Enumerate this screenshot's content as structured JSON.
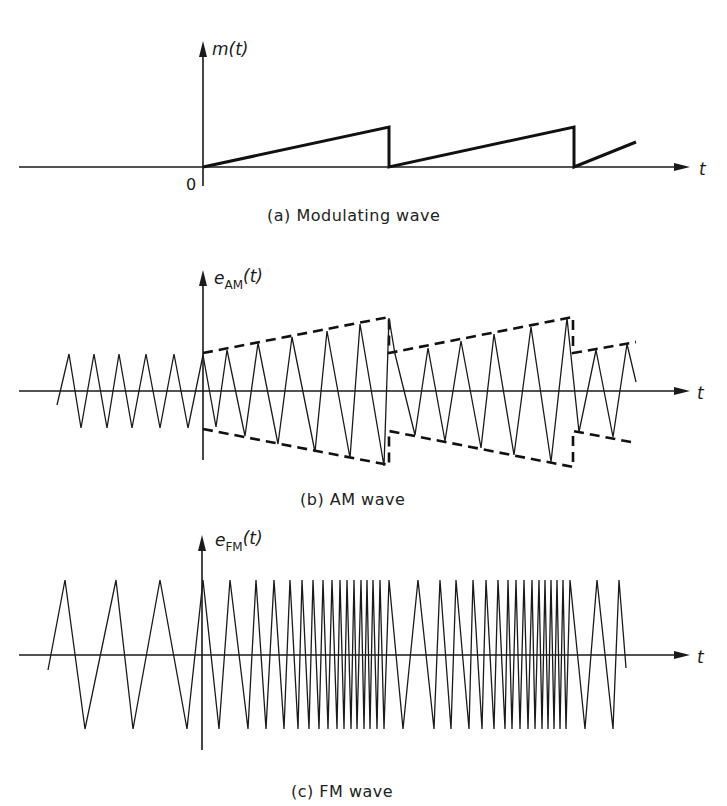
{
  "figure": {
    "panels": [
      {
        "id": "a",
        "caption": "(a) Modulating wave",
        "y_label_main": "m",
        "y_label_sub": "",
        "y_label_arg": "(t)",
        "x_label": "t",
        "origin_label": "0"
      },
      {
        "id": "b",
        "caption": "(b) AM wave",
        "y_label_main": "e",
        "y_label_sub": "AM",
        "y_label_arg": "(t)",
        "x_label": "t"
      },
      {
        "id": "c",
        "caption": "(c) FM wave",
        "y_label_main": "e",
        "y_label_sub": "FM",
        "y_label_arg": "(t)",
        "x_label": "t"
      }
    ]
  },
  "geometry": {
    "a": {
      "axis_y": 167,
      "axis_x0": 19,
      "axis_x1": 690,
      "vaxis_x": 203,
      "vaxis_y0": 41,
      "vaxis_y1": 186,
      "ramp": [
        [
          203,
          167
        ],
        [
          389,
          127
        ],
        [
          389,
          167
        ],
        [
          574,
          127
        ],
        [
          574,
          167
        ],
        [
          636,
          142
        ]
      ]
    },
    "b": {
      "axis_y": 391,
      "axis_x0": 19,
      "axis_x1": 690,
      "vaxis_x": 203,
      "vaxis_y0": 270,
      "vaxis_y1": 460,
      "carrier": [
        [
          57,
          405
        ],
        [
          69,
          354
        ],
        [
          81,
          428
        ],
        [
          94,
          354
        ],
        [
          107,
          428
        ],
        [
          119,
          354
        ],
        [
          132,
          428
        ],
        [
          146,
          354
        ],
        [
          160,
          428
        ],
        [
          174,
          354
        ],
        [
          188,
          428
        ],
        [
          203,
          355
        ],
        [
          216,
          427
        ],
        [
          227,
          350
        ],
        [
          245,
          436
        ],
        [
          258,
          343
        ],
        [
          278,
          444
        ],
        [
          292,
          337
        ],
        [
          315,
          452
        ],
        [
          327,
          331
        ],
        [
          350,
          458
        ],
        [
          360,
          324
        ],
        [
          384,
          466
        ],
        [
          389,
          318
        ],
        [
          395,
          354
        ],
        [
          415,
          435
        ],
        [
          428,
          348
        ],
        [
          445,
          441
        ],
        [
          461,
          341
        ],
        [
          481,
          448
        ],
        [
          494,
          334
        ],
        [
          514,
          455
        ],
        [
          531,
          327
        ],
        [
          551,
          462
        ],
        [
          567,
          318
        ],
        [
          579,
          432
        ],
        [
          596,
          350
        ],
        [
          613,
          437
        ],
        [
          627,
          344
        ],
        [
          636,
          382
        ]
      ],
      "env_upper": [
        [
          203,
          353
        ],
        [
          389,
          317
        ],
        [
          389,
          353
        ],
        [
          573,
          317
        ],
        [
          573,
          353
        ],
        [
          636,
          342
        ]
      ],
      "env_lower": [
        [
          203,
          429
        ],
        [
          389,
          465
        ],
        [
          389,
          431
        ],
        [
          573,
          467
        ],
        [
          573,
          431
        ],
        [
          636,
          443
        ]
      ]
    },
    "c": {
      "axis_y": 655,
      "axis_x0": 19,
      "axis_x1": 690,
      "vaxis_x": 202,
      "vaxis_y0": 535,
      "vaxis_y1": 750,
      "peak_y": 580,
      "trough_y": 729,
      "start": [
        48,
        670
      ],
      "peaks": [
        65,
        116,
        160,
        203,
        230,
        256,
        274,
        290,
        302,
        313,
        323,
        332,
        340,
        347,
        354,
        361,
        367,
        373,
        380,
        389,
        418,
        440,
        456,
        473,
        486,
        498,
        508,
        516,
        524,
        532,
        539,
        545,
        551,
        557,
        563,
        570,
        597,
        619
      ],
      "troughs": [
        85,
        133,
        187,
        219,
        248,
        266,
        284,
        298,
        309,
        319,
        328,
        337,
        344,
        351,
        357,
        364,
        370,
        377,
        384,
        403,
        434,
        451,
        469,
        482,
        494,
        505,
        512,
        520,
        528,
        535,
        542,
        548,
        554,
        560,
        566,
        585,
        613
      ],
      "end": [
        626,
        668
      ]
    }
  },
  "chart_data": {
    "type": "line",
    "series": [
      {
        "name": "m(t) sawtooth modulating wave",
        "shape": "sawtooth",
        "periods": 2.3,
        "start_t": 0
      },
      {
        "name": "e_AM(t) amplitude-modulated carrier",
        "shape": "triangle carrier with sawtooth envelope"
      },
      {
        "name": "e_FM(t) frequency-modulated carrier",
        "shape": "triangle carrier with frequency increasing over each sawtooth ramp"
      }
    ],
    "xlabel": "t",
    "ylabel": [
      "m(t)",
      "e_AM(t)",
      "e_FM(t)"
    ]
  }
}
